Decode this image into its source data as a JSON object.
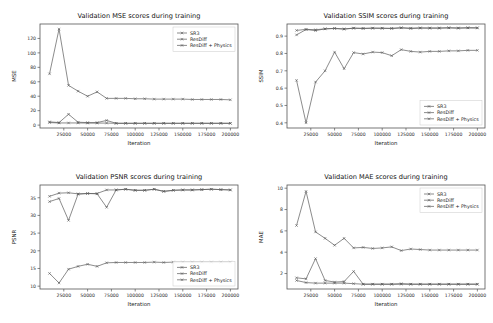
{
  "figure": {
    "background": "#ffffff",
    "line_color": "#5a5a5a",
    "text_color": "#1a1a1a",
    "marker": "x"
  },
  "legend_entries": [
    "SR3",
    "ResDiff",
    "ResDiff + Physics"
  ],
  "common": {
    "xlabel": "Iteration",
    "xticks": [
      25000,
      50000,
      75000,
      100000,
      125000,
      150000,
      175000,
      200000
    ],
    "xticklabels": [
      "25000",
      "50000",
      "75000",
      "100000",
      "125000",
      "150000",
      "175000",
      "200000"
    ],
    "xlim": [
      0,
      208000
    ],
    "x": [
      10000,
      20000,
      30000,
      40000,
      50000,
      60000,
      70000,
      80000,
      90000,
      100000,
      110000,
      120000,
      130000,
      140000,
      150000,
      160000,
      170000,
      180000,
      190000,
      200000
    ]
  },
  "chart_data": [
    {
      "id": "mse",
      "type": "line",
      "title": "Validation MSE scores during training",
      "xlabel": "Iteration",
      "ylabel": "MSE",
      "ylim": [
        -4,
        140
      ],
      "yticks": [
        0,
        20,
        40,
        60,
        80,
        100,
        120
      ],
      "yticklabels": [
        "0",
        "20",
        "40",
        "60",
        "80",
        "100",
        "120"
      ],
      "legend_position": "upper right",
      "grid": false,
      "x": [
        10000,
        20000,
        30000,
        40000,
        50000,
        60000,
        70000,
        80000,
        90000,
        100000,
        110000,
        120000,
        130000,
        140000,
        150000,
        160000,
        170000,
        180000,
        190000,
        200000
      ],
      "series": [
        {
          "name": "SR3",
          "values": [
            71,
            133,
            55,
            47,
            40,
            46,
            37,
            37,
            37,
            36.5,
            36.5,
            36,
            36,
            36,
            36,
            35.5,
            35.5,
            35.5,
            35.5,
            35
          ]
        },
        {
          "name": "ResDiff",
          "values": [
            4.5,
            3.5,
            15,
            4,
            3.5,
            3.5,
            6.5,
            2.5,
            2.5,
            2.5,
            2.5,
            2.5,
            2.5,
            2.5,
            2.5,
            2.5,
            2.5,
            2.5,
            2.5,
            2.5
          ]
        },
        {
          "name": "ResDiff + Physics",
          "values": [
            3.5,
            3,
            3,
            3,
            2.8,
            2.8,
            2.8,
            2.5,
            2.5,
            2.5,
            2.5,
            2.5,
            2.5,
            2.5,
            2.5,
            2.5,
            2.5,
            2.5,
            2.5,
            2.5
          ]
        }
      ]
    },
    {
      "id": "ssim",
      "type": "line",
      "title": "Validation SSIM scores during training",
      "xlabel": "Iteration",
      "ylabel": "SSIM",
      "ylim": [
        0.37,
        0.97
      ],
      "yticks": [
        0.4,
        0.5,
        0.6,
        0.7,
        0.8,
        0.9
      ],
      "yticklabels": [
        "0.4",
        "0.5",
        "0.6",
        "0.7",
        "0.8",
        "0.9"
      ],
      "legend_position": "lower right",
      "grid": false,
      "x": [
        10000,
        20000,
        30000,
        40000,
        50000,
        60000,
        70000,
        80000,
        90000,
        100000,
        110000,
        120000,
        130000,
        140000,
        150000,
        160000,
        170000,
        180000,
        190000,
        200000
      ],
      "series": [
        {
          "name": "SR3",
          "values": [
            0.645,
            0.4,
            0.635,
            0.7,
            0.808,
            0.712,
            0.805,
            0.797,
            0.808,
            0.805,
            0.787,
            0.822,
            0.812,
            0.808,
            0.812,
            0.812,
            0.815,
            0.815,
            0.818,
            0.818
          ]
        },
        {
          "name": "ResDiff",
          "values": [
            0.907,
            0.938,
            0.932,
            0.942,
            0.944,
            0.94,
            0.946,
            0.944,
            0.946,
            0.945,
            0.944,
            0.948,
            0.944,
            0.947,
            0.946,
            0.946,
            0.948,
            0.946,
            0.948,
            0.947
          ]
        },
        {
          "name": "ResDiff + Physics",
          "values": [
            0.933,
            0.939,
            0.937,
            0.942,
            0.945,
            0.942,
            0.946,
            0.945,
            0.946,
            0.946,
            0.945,
            0.948,
            0.946,
            0.947,
            0.947,
            0.947,
            0.948,
            0.947,
            0.948,
            0.948
          ]
        }
      ]
    },
    {
      "id": "psnr",
      "type": "line",
      "title": "Validation PSNR scores during training",
      "xlabel": "Iteration",
      "ylabel": "PSNR",
      "ylim": [
        9.2,
        38.6
      ],
      "yticks": [
        10,
        15,
        20,
        25,
        30,
        35
      ],
      "yticklabels": [
        "10",
        "15",
        "20",
        "25",
        "30",
        "35"
      ],
      "legend_position": "lower right",
      "grid": false,
      "x": [
        10000,
        20000,
        30000,
        40000,
        50000,
        60000,
        70000,
        80000,
        90000,
        100000,
        110000,
        120000,
        130000,
        140000,
        150000,
        160000,
        170000,
        180000,
        190000,
        200000
      ],
      "series": [
        {
          "name": "SR3",
          "values": [
            13.6,
            10.9,
            14.8,
            15.6,
            16.2,
            15.6,
            16.6,
            16.7,
            16.7,
            16.7,
            16.7,
            16.8,
            16.7,
            16.8,
            16.8,
            16.8,
            16.8,
            16.8,
            16.8,
            16.8
          ]
        },
        {
          "name": "ResDiff",
          "values": [
            33.9,
            34.8,
            28.6,
            36.0,
            36.2,
            36.1,
            32.3,
            37.2,
            37.4,
            37.1,
            37.1,
            37.4,
            36.8,
            37.1,
            37.2,
            37.2,
            37.3,
            37.4,
            37.3,
            37.2
          ]
        },
        {
          "name": "ResDiff + Physics",
          "values": [
            35.4,
            36.3,
            36.4,
            36.1,
            36.2,
            36.2,
            37.2,
            37.2,
            37.4,
            37.1,
            37.1,
            37.4,
            36.8,
            37.1,
            37.2,
            37.2,
            37.3,
            37.4,
            37.3,
            37.2
          ]
        }
      ]
    },
    {
      "id": "mae",
      "type": "line",
      "title": "Validation MAE scores during training",
      "xlabel": "Iteration",
      "ylabel": "MAE",
      "ylim": [
        0.55,
        10.3
      ],
      "yticks": [
        2,
        4,
        6,
        8,
        10
      ],
      "yticklabels": [
        "2",
        "4",
        "6",
        "8",
        "10"
      ],
      "legend_position": "upper right",
      "grid": false,
      "x": [
        10000,
        20000,
        30000,
        40000,
        50000,
        60000,
        70000,
        80000,
        90000,
        100000,
        110000,
        120000,
        130000,
        140000,
        150000,
        160000,
        170000,
        180000,
        190000,
        200000
      ],
      "series": [
        {
          "name": "SR3",
          "values": [
            6.5,
            9.7,
            5.9,
            5.3,
            4.65,
            5.3,
            4.4,
            4.45,
            4.35,
            4.4,
            4.5,
            4.15,
            4.3,
            4.25,
            4.2,
            4.2,
            4.2,
            4.2,
            4.2,
            4.2
          ]
        },
        {
          "name": "ResDiff",
          "values": [
            1.6,
            1.5,
            3.4,
            1.35,
            1.2,
            1.25,
            2.2,
            1.0,
            1.0,
            1.0,
            1.0,
            1.05,
            1.0,
            1.0,
            1.0,
            1.0,
            1.0,
            1.0,
            1.0,
            1.0
          ]
        },
        {
          "name": "ResDiff + Physics",
          "values": [
            1.35,
            1.15,
            1.1,
            1.1,
            1.1,
            1.1,
            1.05,
            1.0,
            1.0,
            1.0,
            1.0,
            1.0,
            1.0,
            1.0,
            1.0,
            1.0,
            1.0,
            1.0,
            1.0,
            1.0
          ]
        }
      ]
    }
  ]
}
